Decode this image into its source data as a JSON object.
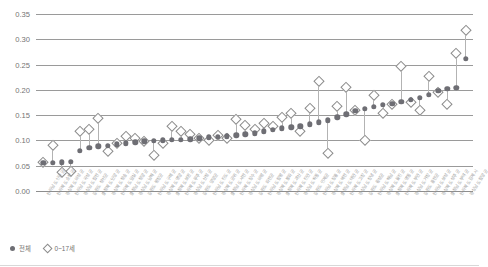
{
  "chart_data": {
    "type": "scatter",
    "title": "",
    "subtitle": "",
    "xlabel": "",
    "ylabel": "",
    "ylim": [
      0.0,
      0.35
    ],
    "ytick_labels": [
      "0.35",
      "0.30",
      "0.25",
      "0.20",
      "0.15",
      "0.10",
      "0.05",
      "0.00"
    ],
    "ytick_values": [
      0.35,
      0.3,
      0.25,
      0.2,
      0.15,
      0.1,
      0.05,
      0.0
    ],
    "grid": true,
    "legend_position": "bottom-left",
    "legend": [
      {
        "label": "전체",
        "marker": "filled-circle",
        "color": "#6e6e74"
      },
      {
        "label": "0~17세",
        "marker": "open-diamond",
        "color": "#8c8c8c"
      }
    ],
    "sorted_by": "전체 ascending",
    "categories": [
      "전라남도 신안군",
      "전라북도 순창군",
      "경상북도 의성군",
      "전라남도 곡성군",
      "경상남도 합천군",
      "강원도 정선군",
      "충청북도 단양군",
      "경상북도 청송군",
      "전라북도 임실군",
      "충청남도 청양군",
      "경상남도 남해군",
      "강원도 평창군",
      "전라남도 구례군",
      "경상북도 영양군",
      "충청북도 보은군",
      "전라북도 무주군",
      "경상남도 산청군",
      "강원도 양양군",
      "전라남도 진도군",
      "경상북도 군위군",
      "충청남도 서천군",
      "전라북도 장수군",
      "경상남도 의령군",
      "강원도 화천군",
      "전라남도 함평군",
      "경상북도 봉화군",
      "충청북도 괴산군",
      "전라북도 진안군",
      "경상남도 하동군",
      "강원도 인제군",
      "전라남도 장흥군",
      "경상북도 예천군",
      "충청남도 태안군",
      "전라북도 고창군",
      "경상남도 창녕군",
      "강원도 횡성군",
      "전라남도 해남군",
      "경상북도 울진군",
      "충청북도 영동군",
      "전라북도 부안군",
      "경상남도 거창군",
      "강원도 홍천군",
      "전라남도 보성군",
      "경상북도 성주군",
      "충청남도 부여군",
      "전라북도 김제시",
      "경상남도 함양군"
    ],
    "series": [
      {
        "name": "전체",
        "marker": "filled-circle",
        "values": [
          0.056,
          0.056,
          0.057,
          0.058,
          0.08,
          0.085,
          0.088,
          0.089,
          0.092,
          0.094,
          0.096,
          0.098,
          0.099,
          0.1,
          0.101,
          0.101,
          0.102,
          0.104,
          0.106,
          0.107,
          0.108,
          0.11,
          0.112,
          0.114,
          0.118,
          0.121,
          0.124,
          0.126,
          0.128,
          0.132,
          0.136,
          0.14,
          0.146,
          0.152,
          0.158,
          0.162,
          0.166,
          0.17,
          0.172,
          0.176,
          0.18,
          0.184,
          0.19,
          0.198,
          0.202,
          0.204,
          0.262
        ]
      },
      {
        "name": "0~17세",
        "marker": "open-diamond",
        "values": [
          0.057,
          0.09,
          0.038,
          0.04,
          0.118,
          0.122,
          0.145,
          0.08,
          0.094,
          0.108,
          0.105,
          0.098,
          0.072,
          0.094,
          0.128,
          0.118,
          0.112,
          0.105,
          0.1,
          0.11,
          0.104,
          0.142,
          0.13,
          0.122,
          0.134,
          0.128,
          0.146,
          0.155,
          0.118,
          0.165,
          0.218,
          0.075,
          0.168,
          0.205,
          0.16,
          0.1,
          0.19,
          0.155,
          0.172,
          0.248,
          0.176,
          0.16,
          0.228,
          0.195,
          0.172,
          0.272,
          0.318
        ]
      }
    ]
  },
  "legend": {
    "total_label": "전체",
    "youth_label": "0~17세"
  }
}
